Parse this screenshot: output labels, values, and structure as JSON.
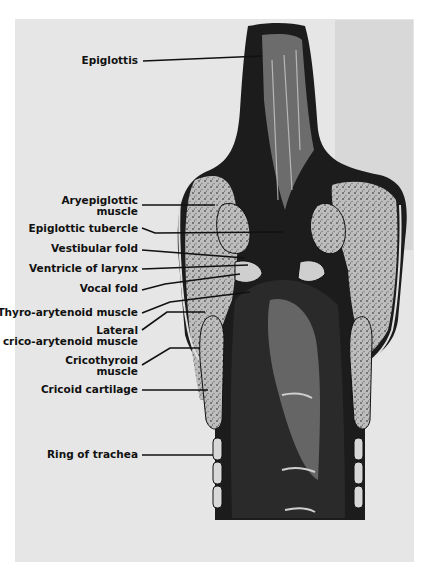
{
  "figure": {
    "labels": [
      {
        "id": "epiglottis",
        "text": "Epiglottis"
      },
      {
        "id": "aryepiglottic-muscle",
        "text": "Aryepiglottic muscle",
        "line1": "Aryepiglottic",
        "line2": "muscle"
      },
      {
        "id": "epiglottic-tubercle",
        "text": "Epiglottic tubercle"
      },
      {
        "id": "vestibular-fold",
        "text": "Vestibular fold"
      },
      {
        "id": "ventricle-of-larynx",
        "text": "Ventricle of larynx"
      },
      {
        "id": "vocal-fold",
        "text": "Vocal fold"
      },
      {
        "id": "thyro-arytenoid-muscle",
        "text": "Thyro-arytenoid muscle"
      },
      {
        "id": "lateral-crico-arytenoid-muscle",
        "text": "Lateral crico-arytenoid muscle",
        "line1": "Lateral",
        "line2": "crico-arytenoid muscle"
      },
      {
        "id": "cricothyroid-muscle",
        "text": "Cricothyroid muscle",
        "line1": "Cricothyroid",
        "line2": "muscle"
      },
      {
        "id": "cricoid-cartilage",
        "text": "Cricoid cartilage"
      },
      {
        "id": "ring-of-trachea",
        "text": "Ring of trachea"
      }
    ]
  },
  "colors": {
    "background": "#ffffff",
    "plate": "#e6e6e6",
    "ink": "#111111",
    "tissue_dark": "#1a1a1a",
    "tissue_mid": "#8a8a8a",
    "tissue_light": "#cfcfcf"
  }
}
